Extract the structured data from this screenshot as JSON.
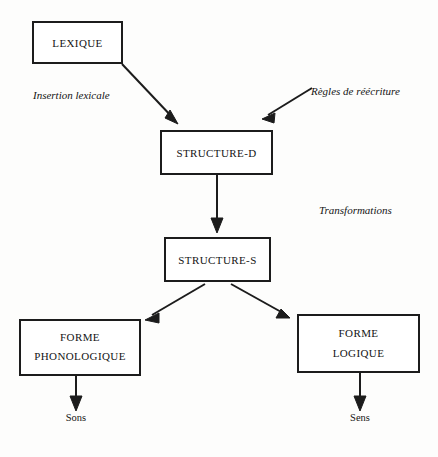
{
  "diagram": {
    "background_color": "#fdfdfc",
    "ink_color": "#1c1c1c",
    "nodes": [
      {
        "id": "lexique",
        "label": "LEXIQUE",
        "x": 33,
        "y": 22,
        "w": 89,
        "h": 41
      },
      {
        "id": "structure-d",
        "label": "STRUCTURE-D",
        "x": 161,
        "y": 131,
        "w": 111,
        "h": 43
      },
      {
        "id": "structure-s",
        "label": "STRUCTURE-S",
        "x": 165,
        "y": 238,
        "w": 105,
        "h": 43
      },
      {
        "id": "forme-phonologique",
        "label_line1": "FORME",
        "label_line2": "PHONOLOGIQUE",
        "x": 20,
        "y": 320,
        "w": 120,
        "h": 55
      },
      {
        "id": "forme-logique",
        "label_line1": "FORME",
        "label_line2": "LOGIQUE",
        "x": 298,
        "y": 315,
        "w": 121,
        "h": 57
      }
    ],
    "annotations": [
      {
        "id": "insertion-lexicale",
        "text": "Insertion lexicale",
        "x": 33,
        "y": 99
      },
      {
        "id": "regles-de-reecriture",
        "text": "Règles de réécriture",
        "x": 311,
        "y": 95
      },
      {
        "id": "transformations",
        "text": "Transformations",
        "x": 319,
        "y": 214
      }
    ],
    "terminals": [
      {
        "id": "sons",
        "label": "Sons",
        "x": 76,
        "y": 421
      },
      {
        "id": "sens",
        "label": "Sens",
        "x": 360,
        "y": 421
      }
    ],
    "edges": [
      {
        "id": "lexique-to-structure-d",
        "from": "lexique",
        "to": "structure-d",
        "kind": "diagonal-down-right"
      },
      {
        "id": "reecriture-to-structure-d",
        "from": "regles-de-reecriture",
        "to": "structure-d",
        "kind": "diagonal-down-left"
      },
      {
        "id": "structure-d-to-structure-s",
        "from": "structure-d",
        "to": "structure-s",
        "kind": "vertical-down"
      },
      {
        "id": "structure-s-to-forme-phonologique",
        "from": "structure-s",
        "to": "forme-phonologique",
        "kind": "diagonal-down-left"
      },
      {
        "id": "structure-s-to-forme-logique",
        "from": "structure-s",
        "to": "forme-logique",
        "kind": "diagonal-down-right"
      },
      {
        "id": "forme-phonologique-to-sons",
        "from": "forme-phonologique",
        "to": "sons",
        "kind": "vertical-down"
      },
      {
        "id": "forme-logique-to-sens",
        "from": "forme-logique",
        "to": "sens",
        "kind": "vertical-down"
      }
    ]
  }
}
